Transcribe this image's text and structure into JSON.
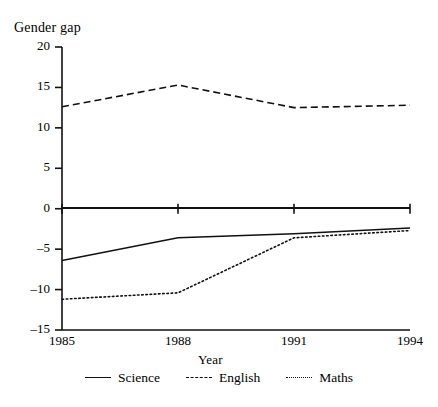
{
  "chart_data": {
    "type": "line",
    "title": "Gender gap",
    "xlabel": "Year",
    "ylabel": "Gender gap",
    "x": [
      1985,
      1988,
      1991,
      1994
    ],
    "categories": [
      "1985",
      "1988",
      "1991",
      "1994"
    ],
    "xtick_labels": [
      "1985",
      "1988",
      "1991",
      "1994"
    ],
    "ytick_labels": [
      "20",
      "15",
      "10",
      "5",
      "0",
      "-5",
      "-10",
      "-15"
    ],
    "ytick_values": [
      20,
      15,
      10,
      5,
      0,
      -5,
      -10,
      -15
    ],
    "xlim": [
      1985,
      1994
    ],
    "ylim": [
      -15,
      20
    ],
    "grid": false,
    "legend_position": "bottom",
    "zero_line": true,
    "series": [
      {
        "name": "Science",
        "style": "solid",
        "color": "#111111",
        "values": [
          -6.4,
          -3.6,
          -3.1,
          -2.4
        ]
      },
      {
        "name": "English",
        "style": "dashed",
        "color": "#111111",
        "values": [
          12.6,
          15.3,
          12.5,
          12.8
        ]
      },
      {
        "name": "Maths",
        "style": "dotted",
        "color": "#111111",
        "values": [
          -11.2,
          -10.4,
          -3.6,
          -2.7
        ]
      }
    ]
  },
  "legend": {
    "items": [
      {
        "label": "Science",
        "style": "solid"
      },
      {
        "label": "English",
        "style": "dashed"
      },
      {
        "label": "Maths",
        "style": "dotted"
      }
    ]
  }
}
